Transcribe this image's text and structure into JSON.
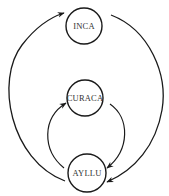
{
  "diagram": {
    "type": "cycle-flow",
    "colors": {
      "stroke": "#1a1a1a",
      "text": "#333333",
      "background": "#ffffff"
    },
    "nodes": [
      {
        "id": "inca",
        "label": "INCA",
        "cx": 84,
        "cy": 26,
        "r": 18
      },
      {
        "id": "curaca",
        "label": "CURACA",
        "cx": 85,
        "cy": 98,
        "r": 18
      },
      {
        "id": "ayllu",
        "label": "AYLLU",
        "cx": 87,
        "cy": 173,
        "r": 19
      }
    ],
    "edges": [
      {
        "from": "ayllu",
        "to": "inca",
        "side": "left",
        "ring": "outer"
      },
      {
        "from": "inca",
        "to": "ayllu",
        "side": "right",
        "ring": "outer"
      },
      {
        "from": "ayllu",
        "to": "curaca",
        "side": "left",
        "ring": "inner"
      },
      {
        "from": "curaca",
        "to": "ayllu",
        "side": "right",
        "ring": "inner"
      }
    ]
  }
}
